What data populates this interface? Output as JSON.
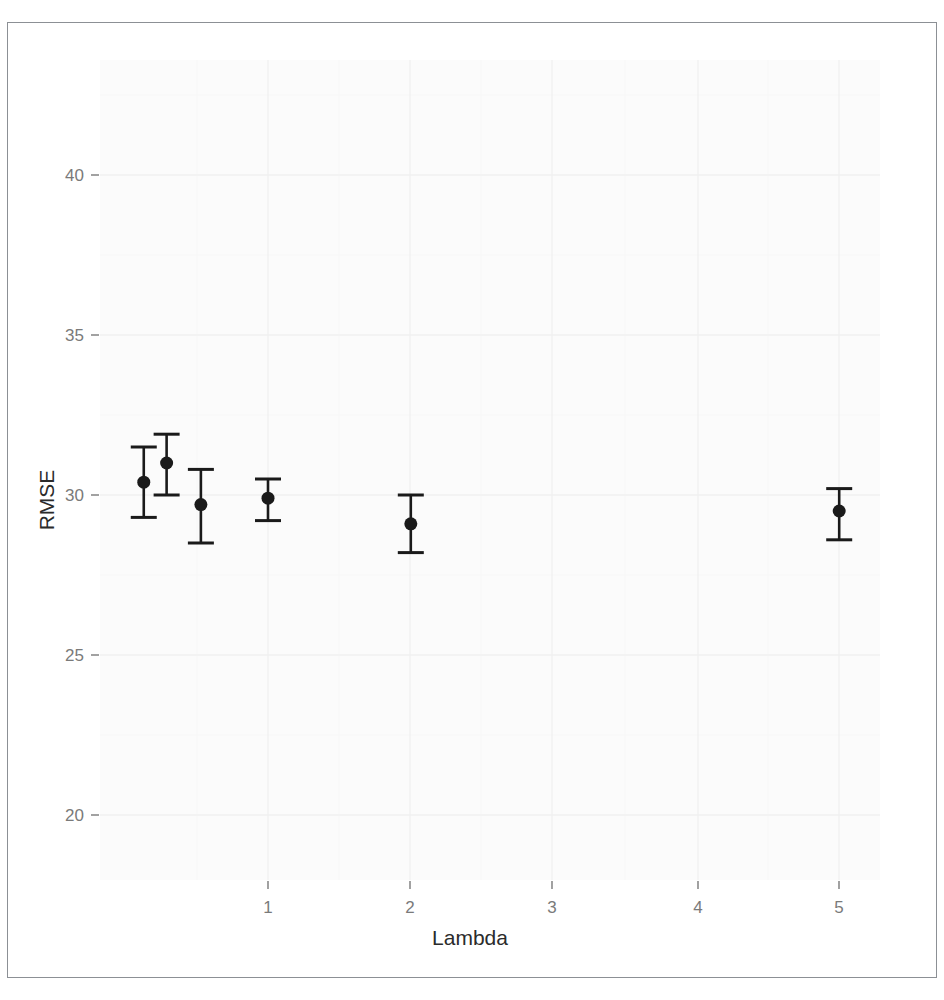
{
  "figure": {
    "background_color": "#ffffff",
    "frame_color": "#8c9095",
    "panel_background_color": "#fbfbfb",
    "grid_color_major": "#f2f2f2",
    "grid_color_minor": "#f8f8f8",
    "point_color": "#1a1a1a",
    "errorbar_color": "#1a1a1a",
    "tick_label_color": "#7a7a7a",
    "axis_title_color": "#2b2b2b"
  },
  "axes": {
    "x_title": "Lambda",
    "y_title": "RMSE",
    "x_ticks": [
      "1",
      "2",
      "3",
      "4",
      "5"
    ],
    "y_ticks": [
      "20",
      "25",
      "30",
      "35",
      "40"
    ]
  },
  "chart_data": {
    "type": "scatter",
    "title": "",
    "subtitle": "",
    "xlabel": "Lambda",
    "ylabel": "RMSE",
    "xlim": [
      -0.2,
      5.5
    ],
    "ylim": [
      17.8,
      43.3
    ],
    "x_ticks": [
      1,
      2,
      3,
      4,
      5
    ],
    "y_ticks": [
      20,
      25,
      30,
      35,
      40
    ],
    "grid": true,
    "legend": null,
    "legend_position": "none",
    "error_bars": "vertical, capped (RMSE +/- SD)",
    "x": [
      0.13,
      0.29,
      0.53,
      1.0,
      2.0,
      5.0
    ],
    "values": [
      30.4,
      31.0,
      29.7,
      29.9,
      29.1,
      29.5
    ],
    "y_upper": [
      31.5,
      31.9,
      30.8,
      30.5,
      30.0,
      30.2
    ],
    "y_lower": [
      29.3,
      30.0,
      28.5,
      29.2,
      28.2,
      28.6
    ],
    "points": [
      {
        "lambda": 0.13,
        "rmse": 30.4,
        "upper": 31.5,
        "lower": 29.3
      },
      {
        "lambda": 0.29,
        "rmse": 31.0,
        "upper": 31.9,
        "lower": 30.0
      },
      {
        "lambda": 0.53,
        "rmse": 29.7,
        "upper": 30.8,
        "lower": 28.5
      },
      {
        "lambda": 1.0,
        "rmse": 29.9,
        "upper": 30.5,
        "lower": 29.2
      },
      {
        "lambda": 2.0,
        "rmse": 29.1,
        "upper": 30.0,
        "lower": 28.2
      },
      {
        "lambda": 5.0,
        "rmse": 29.5,
        "upper": 30.2,
        "lower": 28.6
      }
    ]
  }
}
